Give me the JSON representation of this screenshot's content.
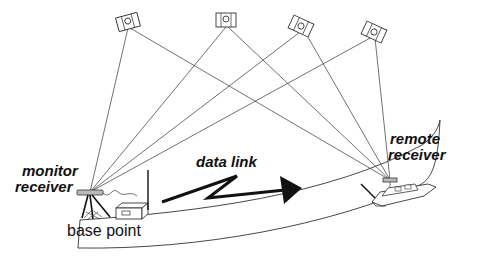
{
  "diagram": {
    "labels": {
      "monitor_line1": "monitor",
      "monitor_line2": "receiver",
      "data_link": "data link",
      "remote_line1": "remote",
      "remote_line2": "receiver",
      "base_point": "base point"
    },
    "satellites": [
      {
        "id": "sat-1",
        "x": 128,
        "y": 22,
        "angle": -15
      },
      {
        "id": "sat-2",
        "x": 226,
        "y": 20,
        "angle": 0
      },
      {
        "id": "sat-3",
        "x": 301,
        "y": 26,
        "angle": 25
      },
      {
        "id": "sat-4",
        "x": 374,
        "y": 32,
        "angle": 25
      }
    ],
    "receivers": {
      "monitor": {
        "x": 90,
        "y": 192
      },
      "remote": {
        "x": 390,
        "y": 180
      }
    },
    "colors": {
      "line": "#333333",
      "text": "#111111",
      "background": "#ffffff"
    }
  }
}
